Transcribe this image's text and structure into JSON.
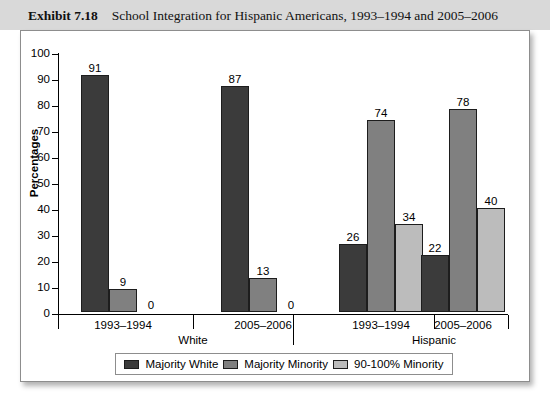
{
  "header": {
    "exhibit_label": "Exhibit 7.18",
    "title": "School Integration for Hispanic Americans, 1993–1994 and 2005–2006"
  },
  "chart_data": {
    "type": "bar",
    "title": "School Integration for Hispanic Americans, 1993–1994 and 2005–2006",
    "xlabel": "",
    "ylabel": "Percentages",
    "ylim": [
      0,
      100
    ],
    "ytick_step": 10,
    "yticks": [
      "100",
      "90",
      "80",
      "70",
      "60",
      "50",
      "40",
      "30",
      "20",
      "10",
      "0"
    ],
    "grid": false,
    "legend_position": "bottom",
    "categories": [
      "1993–1994",
      "2005–2006",
      "1993–1994",
      "2005–2006"
    ],
    "supergroups": [
      {
        "label": "White",
        "categories": [
          "1993–1994",
          "2005–2006"
        ]
      },
      {
        "label": "Hispanic",
        "categories": [
          "1993–1994",
          "2005–2006"
        ]
      }
    ],
    "series": [
      {
        "name": "Majority White",
        "color": "#3b3b3b",
        "values": [
          91,
          87,
          26,
          22
        ]
      },
      {
        "name": "Majority Minority",
        "color": "#808080",
        "values": [
          9,
          13,
          74,
          78
        ]
      },
      {
        "name": "90-100% Minority",
        "color": "#bcbcbc",
        "values": [
          0,
          0,
          34,
          40
        ]
      }
    ],
    "data_labels": [
      [
        "91",
        "9",
        "0"
      ],
      [
        "87",
        "13",
        "0"
      ],
      [
        "26",
        "74",
        "34"
      ],
      [
        "22",
        "78",
        "40"
      ]
    ]
  },
  "legend": {
    "items": [
      {
        "label": "Majority White",
        "swatch": "s0"
      },
      {
        "label": "Majority Minority",
        "swatch": "s1"
      },
      {
        "label": "90-100% Minority",
        "swatch": "s2"
      }
    ]
  }
}
